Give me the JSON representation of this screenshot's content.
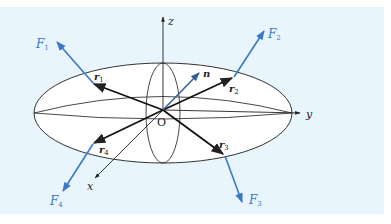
{
  "figure": {
    "background_color": "#e9f5fc",
    "line_color": "#222222",
    "force_color": "#3a78c9",
    "axes": {
      "x": "x",
      "y": "y",
      "z": "z",
      "origin": "O"
    },
    "vectors": {
      "normal": "n",
      "r1": "r",
      "r1_sub": "1",
      "r2": "r",
      "r2_sub": "2",
      "r3": "r",
      "r3_sub": "3",
      "r4": "r",
      "r4_sub": "4"
    },
    "forces": {
      "F1": "F",
      "F1_sub": "1",
      "F2": "F",
      "F2_sub": "2",
      "F3": "F",
      "F3_sub": "3",
      "F4": "F",
      "F4_sub": "4"
    }
  }
}
